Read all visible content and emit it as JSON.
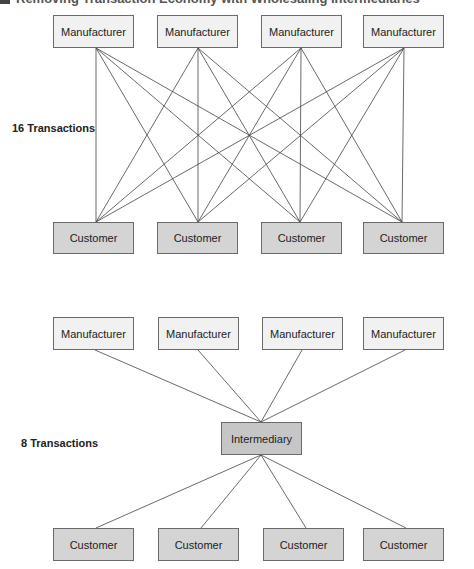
{
  "title": "Removing Transaction Economy with Wholesaling Intermediaries",
  "colors": {
    "manufacturer_fill": "#f1f1f1",
    "customer_fill": "#d4d4d4",
    "intermediary_fill": "#c6c6c6",
    "border": "#6a6a6a",
    "line": "#444444"
  },
  "direct": {
    "label": "16 Transactions",
    "manufacturers": [
      "Manufacturer",
      "Manufacturer",
      "Manufacturer",
      "Manufacturer"
    ],
    "customers": [
      "Customer",
      "Customer",
      "Customer",
      "Customer"
    ]
  },
  "intermediated": {
    "label": "8 Transactions",
    "manufacturers": [
      "Manufacturer",
      "Manufacturer",
      "Manufacturer",
      "Manufacturer"
    ],
    "intermediary": "Intermediary",
    "customers": [
      "Customer",
      "Customer",
      "Customer",
      "Customer"
    ]
  }
}
